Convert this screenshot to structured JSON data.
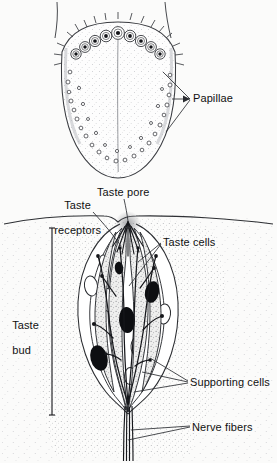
{
  "figure": {
    "background_color": "#fbfbfa",
    "ink_color": "#111111",
    "panels": [
      {
        "name": "tongue-surface-panel",
        "description": "Dorsal view of tongue showing circumvallate papillae in a V arrangement and fungiform papillae along the margins"
      },
      {
        "name": "taste-bud-panel",
        "description": "Cross-section of epithelium containing a taste bud with taste cells, supporting cells, taste pore and nerve fibers"
      }
    ]
  },
  "labels": {
    "papillae": "Papillae",
    "taste_receptors_line1": "Taste",
    "taste_receptors_line2": "receptors",
    "taste_pore": "Taste pore",
    "taste_cells": "Taste cells",
    "supporting_cells": "Supporting cells",
    "nerve_fibers": "Nerve fibers",
    "taste_bud_line1": "Taste",
    "taste_bud_line2": "bud"
  },
  "anatomy": {
    "circumvallate_papillae_count": 9,
    "fungiform_papillae_count": 34,
    "taste_cell_nuclei_count": 4,
    "supporting_cell_nuclei_count": 6,
    "nerve_fiber_strands": 4,
    "leader_lines": {
      "papillae": 3,
      "taste_receptors": 1,
      "taste_pore": 1,
      "taste_cells": 2,
      "supporting_cells": 3,
      "nerve_fibers": 2
    }
  }
}
